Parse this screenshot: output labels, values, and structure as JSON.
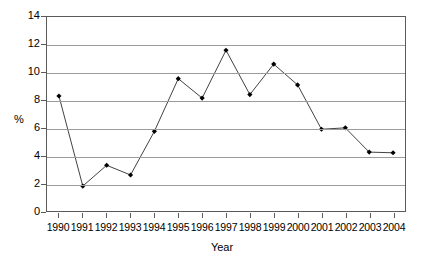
{
  "chart_data": {
    "type": "line",
    "title": "",
    "xlabel": "Year",
    "ylabel": "%",
    "categories": [
      "1990",
      "1991",
      "1992",
      "1993",
      "1994",
      "1995",
      "1996",
      "1997",
      "1998",
      "1999",
      "2000",
      "2001",
      "2002",
      "2003",
      "2004"
    ],
    "values": [
      8.3,
      1.8,
      3.3,
      2.6,
      5.75,
      9.55,
      8.15,
      11.6,
      8.4,
      10.6,
      9.1,
      5.9,
      6.0,
      4.25,
      4.2
    ],
    "ylim": [
      0,
      14
    ],
    "yticks": [
      0,
      2,
      4,
      6,
      8,
      10,
      12,
      14
    ],
    "ytick_labels": [
      "0",
      "2",
      "4",
      "6",
      "8",
      "10",
      "12",
      "14"
    ],
    "grid": true,
    "grid_axis": "y",
    "legend": false,
    "legend_position": "none",
    "marker": "diamond",
    "line_color": "#404040",
    "marker_color": "#000000",
    "grid_color": "#9b9b9b",
    "axis_color": "#5a5a5a",
    "background": "#ffffff"
  }
}
